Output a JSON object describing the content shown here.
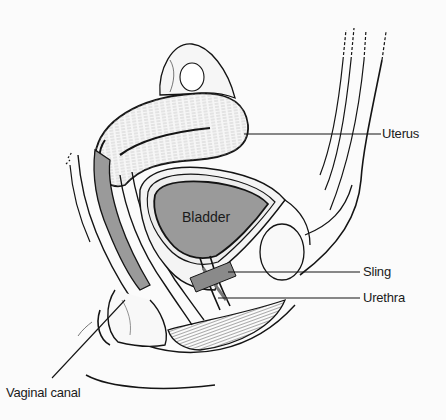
{
  "diagram": {
    "colors": {
      "background": "#fbfbfb",
      "line": "#141414",
      "organ_fill": "#9a9a9a",
      "tissue_fill": "#f4f4f4",
      "hatch": "#6a6a6a"
    },
    "organ_labels": {
      "bladder": "Bladder"
    },
    "callouts": [
      {
        "id": "uterus",
        "label": "Uterus"
      },
      {
        "id": "sling",
        "label": "Sling"
      },
      {
        "id": "urethra",
        "label": "Urethra"
      },
      {
        "id": "vaginal_canal",
        "label": "Vaginal canal"
      }
    ]
  }
}
